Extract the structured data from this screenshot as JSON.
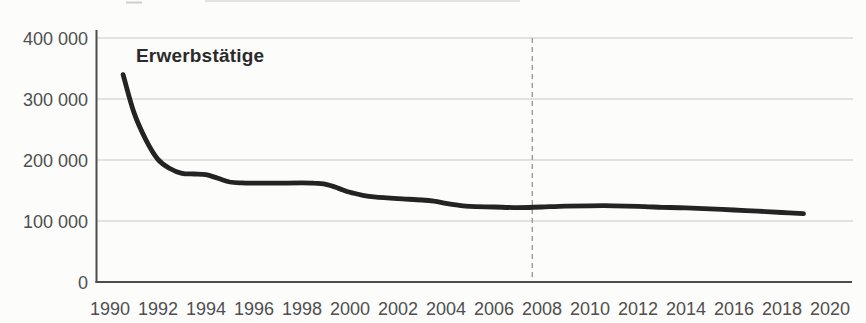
{
  "figure": {
    "series_label": "Erwerbstätige"
  },
  "chart_data": {
    "type": "line",
    "title": "",
    "xlabel": "",
    "ylabel": "",
    "annotation": "Erwerbstätige",
    "grid": true,
    "legend_position": "none",
    "xlim": [
      1989.42,
      2020.92
    ],
    "ylim": [
      0,
      400000
    ],
    "x_ticks": [
      {
        "value": 1990,
        "label": "1990"
      },
      {
        "value": 1992,
        "label": "1992"
      },
      {
        "value": 1994,
        "label": "1994"
      },
      {
        "value": 1996,
        "label": "1996"
      },
      {
        "value": 1998,
        "label": "1998"
      },
      {
        "value": 2000,
        "label": "2000"
      },
      {
        "value": 2002,
        "label": "2002"
      },
      {
        "value": 2004,
        "label": "2004"
      },
      {
        "value": 2006,
        "label": "2006"
      },
      {
        "value": 2008,
        "label": "2008"
      },
      {
        "value": 2010,
        "label": "2010"
      },
      {
        "value": 2012,
        "label": "2012"
      },
      {
        "value": 2014,
        "label": "2014"
      },
      {
        "value": 2016,
        "label": "2016"
      },
      {
        "value": 2018,
        "label": "2018"
      },
      {
        "value": 2020,
        "label": "2020"
      }
    ],
    "y_ticks": [
      {
        "value": 400000,
        "label": "400 000"
      },
      {
        "value": 300000,
        "label": "300 000"
      },
      {
        "value": 200000,
        "label": "200 000"
      },
      {
        "value": 100000,
        "label": "100 000"
      },
      {
        "value": 0,
        "label": "0"
      }
    ],
    "grid_values": [
      100000,
      200000,
      300000,
      400000
    ],
    "reference_line": {
      "x": 2007.6,
      "style": "dashed"
    },
    "series": [
      {
        "name": "Erwerbstätige",
        "points": [
          [
            1990.55,
            340000
          ],
          [
            1991.0,
            278000
          ],
          [
            1991.5,
            233000
          ],
          [
            1992.0,
            201000
          ],
          [
            1992.5,
            186000
          ],
          [
            1993.0,
            178000
          ],
          [
            1993.5,
            177000
          ],
          [
            1994.0,
            176000
          ],
          [
            1994.5,
            170000
          ],
          [
            1995.0,
            164000
          ],
          [
            1995.5,
            162500
          ],
          [
            1996.0,
            162000
          ],
          [
            1997.0,
            162000
          ],
          [
            1998.0,
            162500
          ],
          [
            1998.5,
            162000
          ],
          [
            1999.0,
            160000
          ],
          [
            1999.5,
            154000
          ],
          [
            2000.0,
            147000
          ],
          [
            2000.5,
            142500
          ],
          [
            2001.0,
            139500
          ],
          [
            2002.0,
            136500
          ],
          [
            2003.0,
            134500
          ],
          [
            2003.5,
            132500
          ],
          [
            2004.0,
            129000
          ],
          [
            2004.5,
            126000
          ],
          [
            2005.0,
            124000
          ],
          [
            2006.0,
            123000
          ],
          [
            2007.0,
            122000
          ],
          [
            2008.0,
            123000
          ],
          [
            2009.0,
            124500
          ],
          [
            2010.0,
            125000
          ],
          [
            2011.0,
            125000
          ],
          [
            2012.0,
            124000
          ],
          [
            2013.0,
            122500
          ],
          [
            2014.0,
            121500
          ],
          [
            2015.0,
            120000
          ],
          [
            2016.0,
            118000
          ],
          [
            2017.0,
            116000
          ],
          [
            2018.0,
            114000
          ],
          [
            2018.9,
            112000
          ]
        ]
      }
    ]
  },
  "colors": {
    "background": "#fcfcfb",
    "line": "#232323",
    "axis": "#4d4d4d",
    "grid": "#c8c8c8",
    "tick_label": "#4f4f4f",
    "annotation_label": "#2b2b2b",
    "dashed_line": "#9b9b9b",
    "artifact": "#e3e3e2"
  }
}
